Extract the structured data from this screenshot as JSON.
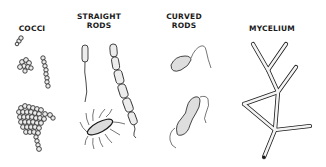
{
  "diagram": {
    "columns": [
      {
        "label": "COCCI",
        "drawings": [
          "single-diplococcus",
          "cluster",
          "chain",
          "large-grape-cluster"
        ]
      },
      {
        "label": "STRAIGHT\nRODS",
        "drawings": [
          "flagellated-rod",
          "chain-of-rods",
          "peritrichous-rod"
        ]
      },
      {
        "label": "CURVED\nRODS",
        "drawings": [
          "vibrio",
          "spirillum"
        ]
      },
      {
        "label": "MYCELIUM",
        "drawings": [
          "branching-hyphae"
        ]
      }
    ],
    "colors": {
      "ink": "#1a1a1a",
      "fill": "#e8e8e8",
      "background": "#ffffff"
    }
  }
}
